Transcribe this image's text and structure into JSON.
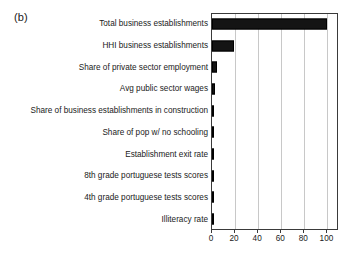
{
  "figure": {
    "panel_label": "(b)"
  },
  "chart_data": {
    "type": "bar",
    "orientation": "horizontal",
    "title": "",
    "subtitle": "",
    "xlabel": "",
    "ylabel": "",
    "xlim": [
      0,
      110
    ],
    "xticks": [
      0,
      20,
      40,
      60,
      80,
      100
    ],
    "xtick_labels": [
      "0",
      "20",
      "40",
      "60",
      "80",
      "100"
    ],
    "grid": "vertical",
    "legend": "none",
    "bar_color": "#141414",
    "categories": [
      "Total business establishments",
      "HHI business establishments",
      "Share of private sector employment",
      "Avg public sector wages",
      "Share of business establishments in construction",
      "Share of pop w/ no schooling",
      "Establishment exit rate",
      "8th grade portuguese tests scores",
      "4th grade portuguese tests scores",
      "Illiteracy rate"
    ],
    "values": [
      100,
      19,
      4,
      2.5,
      2,
      1.2,
      0.4,
      0.3,
      0.2,
      0.1
    ]
  }
}
